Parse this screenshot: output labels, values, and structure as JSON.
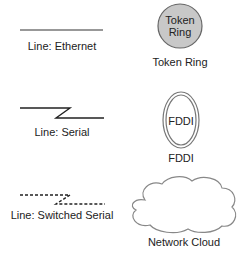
{
  "legend": {
    "items": [
      {
        "id": "ethernet",
        "label": "Line: Ethernet"
      },
      {
        "id": "token-ring",
        "label": "Token Ring",
        "inner_text_line1": "Token",
        "inner_text_line2": "Ring",
        "fill": "#c8c8c8"
      },
      {
        "id": "serial",
        "label": "Line: Serial"
      },
      {
        "id": "fddi",
        "label": "FDDI",
        "inner_text": "FDDI"
      },
      {
        "id": "switched-serial",
        "label": "Line: Switched Serial"
      },
      {
        "id": "network-cloud",
        "label": "Network Cloud"
      }
    ],
    "colors": {
      "line": "#222222",
      "ring_stroke": "#666666",
      "cloud_stroke": "#888888"
    }
  }
}
